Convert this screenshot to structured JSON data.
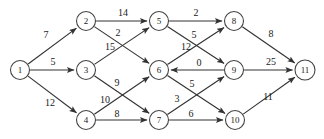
{
  "figure": {
    "width": 324,
    "height": 139,
    "background_color": "#ffffff",
    "edge_color": "#333333",
    "node_fill": "#ffffff",
    "node_stroke": "#444444",
    "text_color": "#1a1a1a"
  },
  "chart_data": {
    "type": "diagram",
    "layout": "layered-dag-left-to-right",
    "title": "",
    "nodes": [
      {
        "id": "1",
        "label": "1",
        "x": 20,
        "y": 70,
        "r": 9.5,
        "layer": 0
      },
      {
        "id": "2",
        "label": "2",
        "x": 86,
        "y": 21,
        "r": 9.5,
        "layer": 1
      },
      {
        "id": "3",
        "label": "3",
        "x": 86,
        "y": 70,
        "r": 9.5,
        "layer": 1
      },
      {
        "id": "4",
        "label": "4",
        "x": 86,
        "y": 120,
        "r": 9.5,
        "layer": 1
      },
      {
        "id": "5",
        "label": "5",
        "x": 159,
        "y": 21,
        "r": 9.5,
        "layer": 2
      },
      {
        "id": "6",
        "label": "6",
        "x": 159,
        "y": 70,
        "r": 9.5,
        "layer": 2
      },
      {
        "id": "7",
        "label": "7",
        "x": 159,
        "y": 120,
        "r": 9.5,
        "layer": 2
      },
      {
        "id": "8",
        "label": "8",
        "x": 234,
        "y": 21,
        "r": 9.5,
        "layer": 3
      },
      {
        "id": "9",
        "label": "9",
        "x": 234,
        "y": 70,
        "r": 9.5,
        "layer": 3
      },
      {
        "id": "10",
        "label": "10",
        "x": 235,
        "y": 120,
        "r": 9.5,
        "layer": 3
      },
      {
        "id": "11",
        "label": "11",
        "x": 305,
        "y": 70,
        "r": 10,
        "layer": 4
      }
    ],
    "edges": [
      {
        "from": "1",
        "to": "2",
        "weight": 7,
        "label_x": 46,
        "label_y": 36
      },
      {
        "from": "1",
        "to": "3",
        "weight": 5,
        "label_x": 53,
        "label_y": 63
      },
      {
        "from": "1",
        "to": "4",
        "weight": 12,
        "label_x": 50,
        "label_y": 104
      },
      {
        "from": "2",
        "to": "5",
        "weight": 14,
        "label_x": 123,
        "label_y": 14
      },
      {
        "from": "2",
        "to": "6",
        "weight": 2,
        "label_x": 118,
        "label_y": 34
      },
      {
        "from": "3",
        "to": "5",
        "weight": 15,
        "label_x": 110,
        "label_y": 48
      },
      {
        "from": "3",
        "to": "7",
        "weight": 9,
        "label_x": 117,
        "label_y": 84
      },
      {
        "from": "4",
        "to": "6",
        "weight": 10,
        "label_x": 105,
        "label_y": 101
      },
      {
        "from": "4",
        "to": "7",
        "weight": 8,
        "label_x": 117,
        "label_y": 115
      },
      {
        "from": "5",
        "to": "8",
        "weight": 2,
        "label_x": 196,
        "label_y": 14
      },
      {
        "from": "5",
        "to": "9",
        "weight": 5,
        "label_x": 194,
        "label_y": 36
      },
      {
        "from": "6",
        "to": "8",
        "weight": 12,
        "label_x": 186,
        "label_y": 48
      },
      {
        "from": "6",
        "to": "10",
        "weight": 5,
        "label_x": 192,
        "label_y": 85
      },
      {
        "from": "7",
        "to": "9",
        "weight": 3,
        "label_x": 177,
        "label_y": 100
      },
      {
        "from": "7",
        "to": "10",
        "weight": 6,
        "label_x": 191,
        "label_y": 115
      },
      {
        "from": "9",
        "to": "6",
        "weight": 0,
        "label_x": 199,
        "label_y": 64
      },
      {
        "from": "8",
        "to": "11",
        "weight": 8,
        "label_x": 271,
        "label_y": 35
      },
      {
        "from": "9",
        "to": "11",
        "weight": 25,
        "label_x": 271,
        "label_y": 63
      },
      {
        "from": "10",
        "to": "11",
        "weight": 11,
        "label_x": 268,
        "label_y": 98
      }
    ]
  }
}
